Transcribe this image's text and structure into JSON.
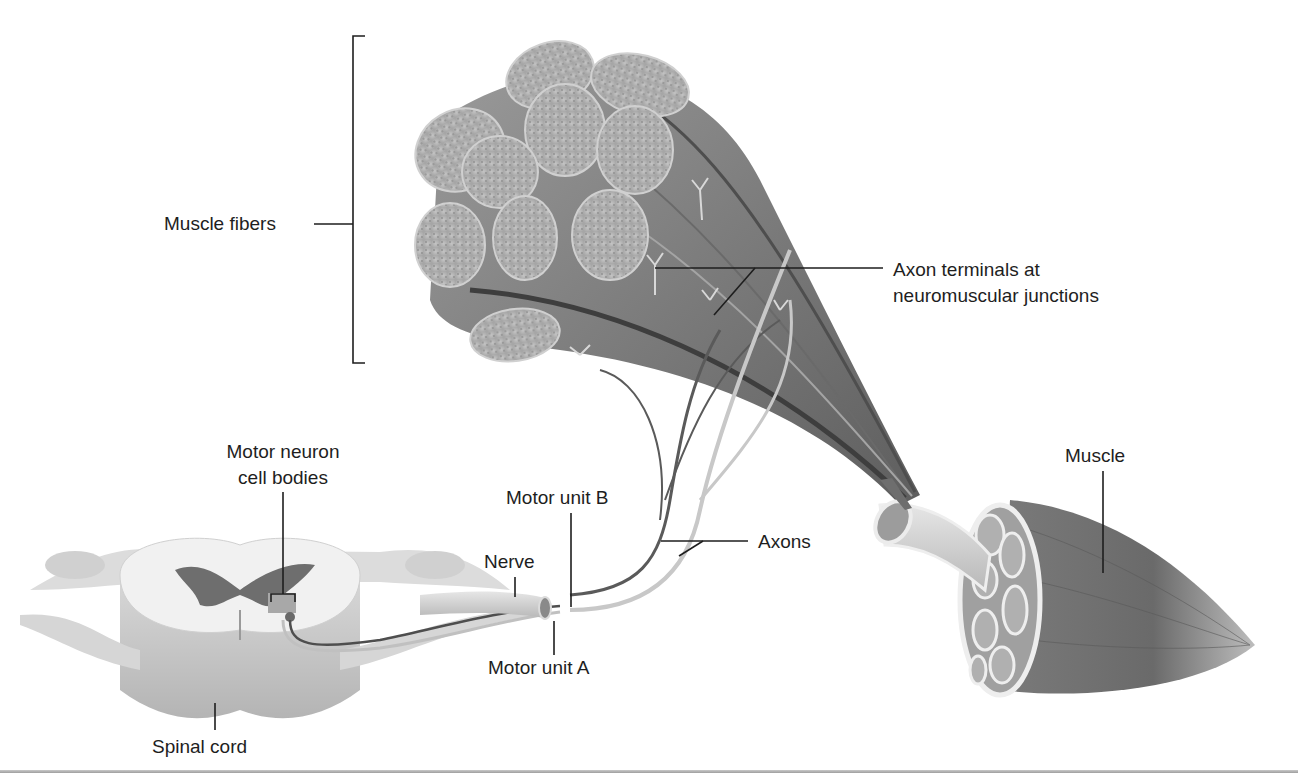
{
  "figure": {
    "colors": {
      "leader_line": "#1e1e1e",
      "fiber_face": "#b8b8b8",
      "fiber_body": "#8a8a8a",
      "fiber_dark": "#555555",
      "spinal_white": "#eeeeee",
      "spinal_gray": "#6e6e6e",
      "axon_dark": "#5a5a5a",
      "axon_light": "#c8c8c8",
      "background": "#ffffff"
    }
  },
  "labels": {
    "muscle_fibers": "Muscle fibers",
    "axon_terminals_line1": "Axon terminals at",
    "axon_terminals_line2": "neuromuscular junctions",
    "motor_neuron_line1": "Motor neuron",
    "motor_neuron_line2": "cell bodies",
    "motor_unit_b": "Motor unit B",
    "nerve": "Nerve",
    "axons": "Axons",
    "muscle": "Muscle",
    "motor_unit_a": "Motor unit A",
    "spinal_cord": "Spinal cord"
  }
}
